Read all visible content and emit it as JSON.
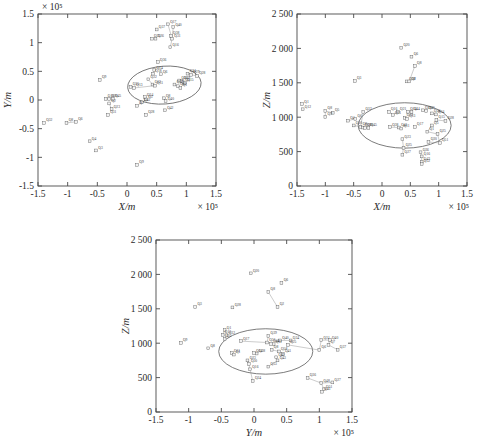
{
  "figure": {
    "background": "#ffffff",
    "panel_count": 3,
    "marker_color": "#555555",
    "ellipse_color": "#5a5a5a",
    "link_color": "#8e8e8e"
  },
  "chart_data": [
    {
      "id": "panel-a",
      "type": "scatter",
      "title": "",
      "xlabel": "X/m",
      "ylabel": "Y/m",
      "x_exponent": "× 10⁵",
      "y_exponent": "× 10⁵",
      "xlim": [
        -1.5,
        1.5
      ],
      "ylim": [
        -1.5,
        1.5
      ],
      "xticks": [
        "-1.5",
        "-1",
        "-0.5",
        "0",
        "0.5",
        "1",
        "1.5"
      ],
      "xtick_values": [
        -1.5,
        -1,
        -0.5,
        0,
        0.5,
        1,
        1.5
      ],
      "yticks": [
        "-1.5",
        "-1",
        "-0.5",
        "0",
        "0.5",
        "1",
        "1.5"
      ],
      "ytick_values": [
        -1.5,
        -1,
        -0.5,
        0,
        0.5,
        1,
        1.5
      ],
      "grid": false,
      "legend": "none",
      "ellipse": {
        "cx": 0.63,
        "cy": 0.26,
        "rx": 0.62,
        "ry": 0.33,
        "rotation": -4
      },
      "points": [
        {
          "label": "Q37",
          "x": 0.5,
          "y": 1.23
        },
        {
          "label": "Q17",
          "x": 0.69,
          "y": 1.32
        },
        {
          "label": "Q40",
          "x": 0.78,
          "y": 1.27
        },
        {
          "label": "Q38",
          "x": 0.74,
          "y": 1.12
        },
        {
          "label": "Q31",
          "x": 0.76,
          "y": 1.07
        },
        {
          "label": "Q25",
          "x": 0.42,
          "y": 1.07
        },
        {
          "label": "Q26",
          "x": 0.48,
          "y": 1.07
        },
        {
          "label": "Q16",
          "x": 0.73,
          "y": 0.92
        },
        {
          "label": "Q36",
          "x": 0.52,
          "y": 0.66
        },
        {
          "label": "Q14",
          "x": 0.46,
          "y": 0.52
        },
        {
          "label": "Q18",
          "x": 0.44,
          "y": 0.46
        },
        {
          "label": "Q6",
          "x": 0.57,
          "y": 0.45
        },
        {
          "label": "Q34",
          "x": 1.02,
          "y": 0.46
        },
        {
          "label": "Q29",
          "x": 1.08,
          "y": 0.44
        },
        {
          "label": "Q28",
          "x": 1.18,
          "y": 0.42
        },
        {
          "label": "Q9",
          "x": -0.46,
          "y": 0.35
        },
        {
          "label": "Q22",
          "x": 0.36,
          "y": 0.36
        },
        {
          "label": "Q30",
          "x": 0.88,
          "y": 0.34
        },
        {
          "label": "Q39",
          "x": 0.92,
          "y": 0.33
        },
        {
          "label": "Q5",
          "x": 0.95,
          "y": 0.31
        },
        {
          "label": "Q15",
          "x": 0.98,
          "y": 0.3
        },
        {
          "label": "Q35",
          "x": 0.06,
          "y": 0.23
        },
        {
          "label": "Q13",
          "x": 0.12,
          "y": 0.21
        },
        {
          "label": "Q12",
          "x": 0.43,
          "y": 0.27
        },
        {
          "label": "Q11",
          "x": 0.47,
          "y": 0.25
        },
        {
          "label": "Q19",
          "x": 0.8,
          "y": 0.27
        },
        {
          "label": "Q21",
          "x": 0.86,
          "y": 0.24
        },
        {
          "label": "Q1",
          "x": 0.9,
          "y": 0.21
        },
        {
          "label": "Q10",
          "x": -0.36,
          "y": 0.02
        },
        {
          "label": "Q20",
          "x": -0.3,
          "y": 0.02
        },
        {
          "label": "Q45",
          "x": -0.24,
          "y": 0.02
        },
        {
          "label": "Q24",
          "x": 0.3,
          "y": 0.05
        },
        {
          "label": "Q5b",
          "x": 0.32,
          "y": 0.01
        },
        {
          "label": "Q8",
          "x": 0.62,
          "y": 0.03
        },
        {
          "label": "Q40b",
          "x": 0.65,
          "y": -0.02
        },
        {
          "label": "Q2",
          "x": -0.3,
          "y": -0.06
        },
        {
          "label": "Q41",
          "x": 0.25,
          "y": -0.04
        },
        {
          "label": "Q23",
          "x": -0.26,
          "y": -0.16
        },
        {
          "label": "Q7",
          "x": 0.17,
          "y": -0.1
        },
        {
          "label": "Q42",
          "x": 0.64,
          "y": -0.18
        },
        {
          "label": "Q28b",
          "x": 0.32,
          "y": -0.26
        },
        {
          "label": "Q31b",
          "x": -0.32,
          "y": -0.26
        },
        {
          "label": "Q32",
          "x": -1.4,
          "y": -0.4
        },
        {
          "label": "Q8b",
          "x": -1.02,
          "y": -0.4
        },
        {
          "label": "Q6b",
          "x": -0.86,
          "y": -0.38
        },
        {
          "label": "Q4",
          "x": -0.63,
          "y": -0.72
        },
        {
          "label": "Q3",
          "x": -0.52,
          "y": -0.88
        },
        {
          "label": "Q9b",
          "x": 0.17,
          "y": -1.13
        }
      ],
      "links": [
        [
          "Q17",
          "Q31"
        ],
        [
          "Q40",
          "Q31"
        ],
        [
          "Q38",
          "Q31"
        ],
        [
          "Q31",
          "Q16"
        ],
        [
          "Q14",
          "Q18"
        ],
        [
          "Q22",
          "Q12"
        ],
        [
          "Q12",
          "Q11"
        ],
        [
          "Q30",
          "Q39"
        ],
        [
          "Q39",
          "Q5"
        ],
        [
          "Q5",
          "Q15"
        ],
        [
          "Q19",
          "Q21"
        ],
        [
          "Q21",
          "Q1"
        ],
        [
          "Q10",
          "Q20"
        ],
        [
          "Q20",
          "Q45"
        ],
        [
          "Q2",
          "Q23"
        ],
        [
          "Q24",
          "Q5b"
        ],
        [
          "Q8",
          "Q40b"
        ],
        [
          "Q41",
          "Q7"
        ],
        [
          "Q8b",
          "Q6b"
        ],
        [
          "Q35",
          "Q13"
        ],
        [
          "Q13",
          "Q11"
        ],
        [
          "Q34",
          "Q29"
        ],
        [
          "Q29",
          "Q28"
        ]
      ]
    },
    {
      "id": "panel-b",
      "type": "scatter",
      "title": "",
      "xlabel": "X/m",
      "ylabel": "Z/m",
      "x_exponent": "× 10⁵",
      "y_exponent": "",
      "xlim": [
        -1.5,
        1.5
      ],
      "ylim": [
        0,
        2500
      ],
      "xticks": [
        "-1.5",
        "-1",
        "-0.5",
        "0",
        "0.5",
        "1",
        "1.5"
      ],
      "xtick_values": [
        -1.5,
        -1,
        -0.5,
        0,
        0.5,
        1,
        1.5
      ],
      "yticks": [
        "0",
        "500",
        "1 000",
        "1 500",
        "2 000",
        "2 500"
      ],
      "ytick_values": [
        0,
        500,
        1000,
        1500,
        2000,
        2500
      ],
      "grid": false,
      "legend": "none",
      "ellipse": {
        "cx": 0.4,
        "cy": 880,
        "rx": 0.82,
        "ry": 330,
        "rotation": 0
      },
      "points": [
        {
          "label": "Q20",
          "x": 0.34,
          "y": 2010
        },
        {
          "label": "Q6",
          "x": 0.52,
          "y": 1880
        },
        {
          "label": "Q8",
          "x": 0.58,
          "y": 1745
        },
        {
          "label": "Q38",
          "x": 0.44,
          "y": 1520
        },
        {
          "label": "Q2",
          "x": 0.48,
          "y": 1520
        },
        {
          "label": "Q3",
          "x": -0.48,
          "y": 1525
        },
        {
          "label": "Q1",
          "x": -1.41,
          "y": 1190
        },
        {
          "label": "Q12",
          "x": -1.4,
          "y": 1115
        },
        {
          "label": "Q8b",
          "x": -1.0,
          "y": 1090
        },
        {
          "label": "Q5",
          "x": -0.87,
          "y": 1065
        },
        {
          "label": "Q9",
          "x": -1.0,
          "y": 1005
        },
        {
          "label": "Q32",
          "x": -0.33,
          "y": 1075
        },
        {
          "label": "Q16",
          "x": 0.12,
          "y": 1075
        },
        {
          "label": "Q21",
          "x": 0.28,
          "y": 1080
        },
        {
          "label": "Q14",
          "x": 0.46,
          "y": 1080
        },
        {
          "label": "Q44",
          "x": 0.52,
          "y": 1078
        },
        {
          "label": "Q39",
          "x": 0.72,
          "y": 1100
        },
        {
          "label": "Q40",
          "x": 0.78,
          "y": 1090
        },
        {
          "label": "Q31",
          "x": 0.19,
          "y": 1030
        },
        {
          "label": "Q24",
          "x": 0.88,
          "y": 1055
        },
        {
          "label": "Q34",
          "x": 0.95,
          "y": 1040
        },
        {
          "label": "Q4",
          "x": -0.6,
          "y": 950
        },
        {
          "label": "Q6b",
          "x": -0.47,
          "y": 975
        },
        {
          "label": "Q23",
          "x": 0.4,
          "y": 990
        },
        {
          "label": "Q13",
          "x": 0.44,
          "y": 975
        },
        {
          "label": "Q15",
          "x": 0.96,
          "y": 960
        },
        {
          "label": "Q28",
          "x": 1.12,
          "y": 945
        },
        {
          "label": "Q10",
          "x": -0.5,
          "y": 880
        },
        {
          "label": "Q8c",
          "x": -0.38,
          "y": 860
        },
        {
          "label": "Q18",
          "x": -0.34,
          "y": 850
        },
        {
          "label": "Q20b",
          "x": -0.3,
          "y": 845
        },
        {
          "label": "Q45",
          "x": -0.24,
          "y": 845
        },
        {
          "label": "Q38b",
          "x": 0.14,
          "y": 855
        },
        {
          "label": "Q41",
          "x": 0.3,
          "y": 850
        },
        {
          "label": "Q11",
          "x": 0.34,
          "y": 835
        },
        {
          "label": "Q17",
          "x": 0.58,
          "y": 860
        },
        {
          "label": "Q5b",
          "x": 0.88,
          "y": 880
        },
        {
          "label": "Q1b",
          "x": 0.8,
          "y": 790
        },
        {
          "label": "Q25b",
          "x": 0.98,
          "y": 755
        },
        {
          "label": "Q23b",
          "x": 0.36,
          "y": 680
        },
        {
          "label": "Q30",
          "x": 0.82,
          "y": 640
        },
        {
          "label": "Q51",
          "x": 1.02,
          "y": 625
        },
        {
          "label": "Q25",
          "x": 0.38,
          "y": 555
        },
        {
          "label": "Q36",
          "x": 0.68,
          "y": 490
        },
        {
          "label": "Q27",
          "x": 0.36,
          "y": 455
        },
        {
          "label": "Q16b",
          "x": 0.7,
          "y": 430
        },
        {
          "label": "Q43",
          "x": 0.7,
          "y": 350
        },
        {
          "label": "Q52",
          "x": 0.7,
          "y": 320
        }
      ],
      "links": [
        [
          "Q8",
          "Q2"
        ],
        [
          "Q38",
          "Q2"
        ],
        [
          "Q8b",
          "Q5"
        ],
        [
          "Q8b",
          "Q9"
        ],
        [
          "Q32",
          "Q8c"
        ],
        [
          "Q16",
          "Q31"
        ],
        [
          "Q21",
          "Q31"
        ],
        [
          "Q14",
          "Q44"
        ],
        [
          "Q39",
          "Q40"
        ],
        [
          "Q24",
          "Q34"
        ],
        [
          "Q10",
          "Q8c"
        ],
        [
          "Q8c",
          "Q18"
        ],
        [
          "Q18",
          "Q20b"
        ],
        [
          "Q20b",
          "Q45"
        ],
        [
          "Q38b",
          "Q41"
        ],
        [
          "Q41",
          "Q11"
        ],
        [
          "Q5b",
          "Q1b"
        ],
        [
          "Q1b",
          "Q25b"
        ],
        [
          "Q25b",
          "Q51"
        ],
        [
          "Q30",
          "Q51"
        ],
        [
          "Q23b",
          "Q25"
        ],
        [
          "Q25",
          "Q27"
        ],
        [
          "Q36",
          "Q16b"
        ],
        [
          "Q16b",
          "Q43"
        ],
        [
          "Q43",
          "Q52"
        ],
        [
          "Q15",
          "Q28"
        ],
        [
          "Q23",
          "Q13"
        ],
        [
          "Q4",
          "Q6b"
        ]
      ]
    },
    {
      "id": "panel-c",
      "type": "scatter",
      "title": "",
      "xlabel": "Y/m",
      "ylabel": "Z/m",
      "x_exponent": "× 10⁵",
      "y_exponent": "",
      "xlim": [
        -1.5,
        1.5
      ],
      "ylim": [
        0,
        2500
      ],
      "xticks": [
        "-1.5",
        "-1",
        "-0.5",
        "0",
        "0.5",
        "1",
        "1.5"
      ],
      "xtick_values": [
        -1.5,
        -1,
        -0.5,
        0,
        0.5,
        1,
        1.5
      ],
      "yticks": [
        "0",
        "500",
        "1 000",
        "1 500",
        "2 000",
        "2 500"
      ],
      "ytick_values": [
        0,
        500,
        1000,
        1500,
        2000,
        2500
      ],
      "grid": false,
      "legend": "none",
      "ellipse": {
        "cx": 0.18,
        "cy": 880,
        "rx": 0.72,
        "ry": 330,
        "rotation": 0
      },
      "points": [
        {
          "label": "Q20",
          "x": -0.05,
          "y": 2015
        },
        {
          "label": "Q6",
          "x": 0.42,
          "y": 1875
        },
        {
          "label": "Q8",
          "x": 0.22,
          "y": 1745
        },
        {
          "label": "Q2",
          "x": 0.36,
          "y": 1525
        },
        {
          "label": "Q28",
          "x": -0.33,
          "y": 1520
        },
        {
          "label": "Q3",
          "x": -0.9,
          "y": 1525
        },
        {
          "label": "Q1",
          "x": -0.45,
          "y": 1190
        },
        {
          "label": "Q12",
          "x": -0.48,
          "y": 1120
        },
        {
          "label": "Q32",
          "x": -0.42,
          "y": 1115
        },
        {
          "label": "Q39",
          "x": 0.22,
          "y": 1105
        },
        {
          "label": "Q5",
          "x": -0.45,
          "y": 1060
        },
        {
          "label": "Q9",
          "x": -1.12,
          "y": 1005
        },
        {
          "label": "Q8b",
          "x": -0.7,
          "y": 925
        },
        {
          "label": "Q17",
          "x": -0.2,
          "y": 1030
        },
        {
          "label": "Q40",
          "x": 0.4,
          "y": 1040
        },
        {
          "label": "Q34",
          "x": 0.56,
          "y": 1040
        },
        {
          "label": "Q31",
          "x": 1.03,
          "y": 1045
        },
        {
          "label": "Q40b",
          "x": 1.16,
          "y": 1045
        },
        {
          "label": "Q31b",
          "x": 0.2,
          "y": 1010
        },
        {
          "label": "Q44",
          "x": 0.26,
          "y": 990
        },
        {
          "label": "Q11",
          "x": 0.3,
          "y": 985
        },
        {
          "label": "Q25",
          "x": 0.52,
          "y": 975
        },
        {
          "label": "Q7",
          "x": 1.14,
          "y": 975
        },
        {
          "label": "Q6b",
          "x": 1.0,
          "y": 900
        },
        {
          "label": "Q37",
          "x": 1.28,
          "y": 905
        },
        {
          "label": "Q11b",
          "x": -0.34,
          "y": 855
        },
        {
          "label": "Q1b",
          "x": -0.31,
          "y": 835
        },
        {
          "label": "Q14",
          "x": 0.0,
          "y": 855
        },
        {
          "label": "Q38",
          "x": 0.04,
          "y": 850
        },
        {
          "label": "Q8c",
          "x": 0.27,
          "y": 905
        },
        {
          "label": "Q58",
          "x": 0.38,
          "y": 880
        },
        {
          "label": "Q41",
          "x": 0.44,
          "y": 845
        },
        {
          "label": "Q23",
          "x": -0.1,
          "y": 750
        },
        {
          "label": "Q30",
          "x": -0.08,
          "y": 700
        },
        {
          "label": "Q45",
          "x": 0.34,
          "y": 795
        },
        {
          "label": "Q43",
          "x": 0.36,
          "y": 750
        },
        {
          "label": "Q53",
          "x": 0.22,
          "y": 660
        },
        {
          "label": "Q16",
          "x": -0.06,
          "y": 620
        },
        {
          "label": "Q36",
          "x": 0.82,
          "y": 495
        },
        {
          "label": "Q24",
          "x": -0.02,
          "y": 450
        },
        {
          "label": "Q48",
          "x": 1.03,
          "y": 420
        },
        {
          "label": "Q27",
          "x": 1.2,
          "y": 430
        },
        {
          "label": "Q51",
          "x": 1.07,
          "y": 330
        },
        {
          "label": "Q43b",
          "x": 1.04,
          "y": 295
        }
      ],
      "links": [
        [
          "Q8",
          "Q2"
        ],
        [
          "Q1",
          "Q12"
        ],
        [
          "Q12",
          "Q32"
        ],
        [
          "Q32",
          "Q5"
        ],
        [
          "Q17",
          "Q31b"
        ],
        [
          "Q39",
          "Q31b"
        ],
        [
          "Q40",
          "Q34"
        ],
        [
          "Q31",
          "Q40b"
        ],
        [
          "Q31",
          "Q6b"
        ],
        [
          "Q40b",
          "Q7"
        ],
        [
          "Q7",
          "Q37"
        ],
        [
          "Q11b",
          "Q1b"
        ],
        [
          "Q14",
          "Q38"
        ],
        [
          "Q31b",
          "Q44"
        ],
        [
          "Q44",
          "Q11"
        ],
        [
          "Q8c",
          "Q58"
        ],
        [
          "Q58",
          "Q41"
        ],
        [
          "Q45",
          "Q43"
        ],
        [
          "Q23",
          "Q30"
        ],
        [
          "Q30",
          "Q16"
        ],
        [
          "Q16",
          "Q24"
        ],
        [
          "Q53",
          "Q43"
        ],
        [
          "Q36",
          "Q48"
        ],
        [
          "Q48",
          "Q27"
        ],
        [
          "Q48",
          "Q51"
        ],
        [
          "Q51",
          "Q43b"
        ],
        [
          "Q25",
          "Q6b"
        ]
      ]
    }
  ]
}
